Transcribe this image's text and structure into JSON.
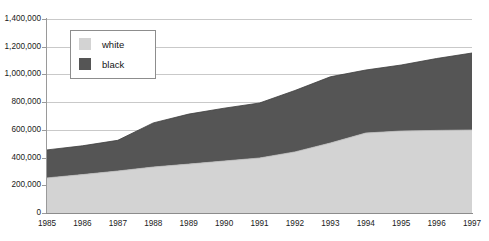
{
  "chart_data": {
    "type": "area",
    "stacked": true,
    "title": "",
    "xlabel": "",
    "ylabel": "",
    "categories": [
      "1985",
      "1986",
      "1987",
      "1988",
      "1989",
      "1990",
      "1991",
      "1992",
      "1993",
      "1994",
      "1995",
      "1996",
      "1997"
    ],
    "x": [
      1985,
      1986,
      1987,
      1988,
      1989,
      1990,
      1991,
      1992,
      1993,
      1994,
      1995,
      1996,
      1997
    ],
    "series": [
      {
        "name": "white",
        "color": "#d3d3d3",
        "values": [
          253000,
          277000,
          303000,
          332000,
          353000,
          375000,
          397000,
          441000,
          505000,
          577000,
          592000,
          596000,
          599000
        ]
      },
      {
        "name": "black",
        "color": "#555555",
        "values": [
          202000,
          208000,
          222000,
          318000,
          361000,
          381000,
          397000,
          443000,
          478000,
          455000,
          476000,
          519000,
          556000
        ]
      }
    ],
    "totals": [
      455000,
      485000,
      525000,
      650000,
      714000,
      756000,
      794000,
      884000,
      983000,
      1032000,
      1068000,
      1115000,
      1155000
    ],
    "ylim": [
      0,
      1400000
    ],
    "ytick_values": [
      0,
      200000,
      400000,
      600000,
      800000,
      1000000,
      1200000,
      1400000
    ],
    "ytick_labels": [
      "0",
      "200,000",
      "400,000",
      "600,000",
      "800,000",
      "1,000,000",
      "1,200,000",
      "1,400,000"
    ],
    "grid": true,
    "legend_position": "upper-left-inside",
    "legend_entries": [
      {
        "label": "white",
        "color": "#d3d3d3"
      },
      {
        "label": "black",
        "color": "#555555"
      }
    ],
    "colors": {
      "white_series": "#d3d3d3",
      "black_series": "#555555",
      "gridline": "#c9c9c9",
      "axis": "#8c8c8c",
      "text": "#1a1a1a",
      "background": "#ffffff"
    }
  }
}
